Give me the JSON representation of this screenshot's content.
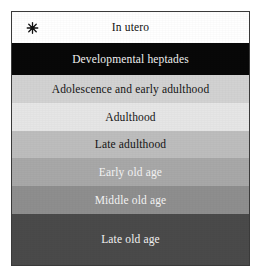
{
  "figure": {
    "name": "life-stages-band-diagram",
    "border_color": "#3a3a3a",
    "background": "#ffffff"
  },
  "marker": {
    "icon": "asterisk-icon",
    "color": "#111111"
  },
  "chart_data": {
    "type": "bar",
    "title": "",
    "xlabel": "",
    "ylabel": "",
    "orientation": "horizontal-bands",
    "categories": [
      "In utero",
      "Developmental heptades",
      "Adolescence and early adulthood",
      "Adulthood",
      "Late adulthood",
      "Early old age",
      "Middle old age",
      "Late old age"
    ],
    "values": [
      31,
      32,
      28,
      28,
      27,
      28,
      28,
      51
    ],
    "legend": [],
    "grid": false
  },
  "bands": [
    {
      "label": "In utero",
      "bg": "#ffffff",
      "fg": "#111111",
      "height": 31,
      "has_marker": true
    },
    {
      "label": "Developmental heptades",
      "bg": "#080808",
      "fg": "#f2f2f2",
      "height": 32,
      "has_marker": false
    },
    {
      "label": "Adolescence and early adulthood",
      "bg": "#d2d2d2",
      "fg": "#141414",
      "height": 28,
      "has_marker": false
    },
    {
      "label": "Adulthood",
      "bg": "#e6e6e6",
      "fg": "#141414",
      "height": 28,
      "has_marker": false
    },
    {
      "label": "Late adulthood",
      "bg": "#bdbdbd",
      "fg": "#141414",
      "height": 27,
      "has_marker": false
    },
    {
      "label": "Early old age",
      "bg": "#a8a8a8",
      "fg": "#f4f4f4",
      "height": 28,
      "has_marker": false
    },
    {
      "label": "Middle old age",
      "bg": "#8e8e8e",
      "fg": "#f4f4f4",
      "height": 28,
      "has_marker": false
    },
    {
      "label": "Late old age",
      "bg": "#4a4a4a",
      "fg": "#f4f4f4",
      "height": 51,
      "has_marker": false
    }
  ]
}
